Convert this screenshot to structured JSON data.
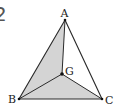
{
  "problem_number": "2",
  "points": {
    "A": {
      "label": "A",
      "x": 65,
      "y": 20
    },
    "B": {
      "label": "B",
      "x": 19,
      "y": 99
    },
    "C": {
      "label": "C",
      "x": 102,
      "y": 99
    },
    "G": {
      "label": "G",
      "x": 62,
      "y": 74
    }
  },
  "shaded_regions": [
    "ABG",
    "BGC"
  ],
  "colors": {
    "shade": "#d4d4d4",
    "line": "#2a2a2a",
    "background": "#ffffff"
  }
}
